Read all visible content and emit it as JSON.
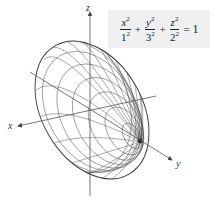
{
  "figure": {
    "equation": {
      "terms": [
        {
          "num_var": "x",
          "num_exp": "2",
          "den_base": "1",
          "den_exp": "2"
        },
        {
          "num_var": "y",
          "num_exp": "2",
          "den_base": "3",
          "den_exp": "2"
        },
        {
          "num_var": "z",
          "num_exp": "2",
          "den_base": "2",
          "den_exp": "2"
        }
      ],
      "plus": "+",
      "equals": "=",
      "rhs": "1"
    },
    "axes": {
      "x_label": "x",
      "y_label": "y",
      "z_label": "z"
    },
    "colors": {
      "line": "#333333",
      "box_bg": "#f0f0f0"
    }
  }
}
